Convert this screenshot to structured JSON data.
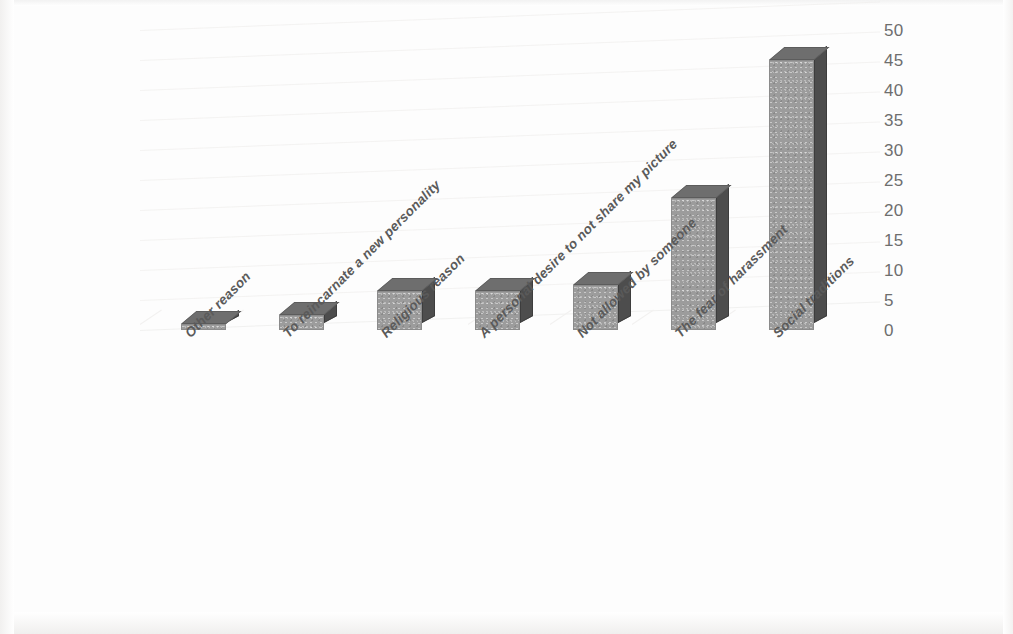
{
  "chart_data": {
    "type": "bar",
    "title": "",
    "subtitle": "",
    "xlabel": "",
    "ylabel": "",
    "categories": [
      "Other reason",
      "To reincarnate a new personality",
      "Religious reason",
      "A personal desire to not share my picture",
      "Not allowed by someone",
      "The fear of harassment",
      "Social traditions"
    ],
    "values": [
      1,
      2.5,
      6.5,
      6.5,
      7.5,
      22,
      45
    ],
    "ylim": [
      0,
      50
    ],
    "yticks": [
      50,
      45,
      40,
      35,
      30,
      25,
      20,
      15,
      10,
      5,
      0
    ],
    "grid": true,
    "legend": "none",
    "style": "3d-column",
    "series": [
      {
        "name": "Reasons for not sharing a picture",
        "values": [
          1,
          2.5,
          6.5,
          6.5,
          7.5,
          22,
          45
        ]
      }
    ],
    "colors": {
      "bar_front": "#9c9c9c",
      "bar_side": "#4d4d4d",
      "bar_top": "#6e6e6e",
      "gridline": "#f0efee",
      "tick_text": "#6e6e6e",
      "category_text": "#5a5a5a",
      "background": "#fdfdfd"
    }
  }
}
